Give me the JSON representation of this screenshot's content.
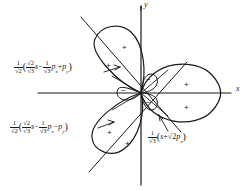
{
  "figure": {
    "axes": {
      "x_label": "x",
      "y_label": "y",
      "origin": [
        141,
        93
      ]
    },
    "annotations": [
      {
        "id": "upper-left-orbital",
        "position": "upper-left",
        "prefix_frac": {
          "num": "1",
          "den": "√2"
        },
        "open_paren": "(",
        "inner_frac": {
          "num": "√2",
          "den": "√3"
        },
        "orbital1": "s",
        "op1": "−",
        "second_frac": {
          "num": "1",
          "den": "√3"
        },
        "orbital2": "p",
        "orbital2_sub": "x",
        "op2": "+",
        "orbital3": "p",
        "orbital3_sub": "y",
        "close_paren": ")"
      },
      {
        "id": "lower-left-orbital",
        "position": "lower-left",
        "prefix_frac": {
          "num": "1",
          "den": "√2"
        },
        "open_paren": "(",
        "inner_frac": {
          "num": "√2",
          "den": "√3"
        },
        "orbital1": "s",
        "op1": "−",
        "second_frac": {
          "num": "1",
          "den": "√3"
        },
        "orbital2": "p",
        "orbital2_sub": "x",
        "op2": "−",
        "orbital3": "p",
        "orbital3_sub": "y",
        "close_paren": ")"
      },
      {
        "id": "right-orbital",
        "position": "lower-right",
        "prefix_frac": {
          "num": "1",
          "den": "√3"
        },
        "open_paren": "(",
        "orbital1": "s",
        "op1": "+",
        "radical": "√2",
        "orbital2": "p",
        "orbital2_sub": "x",
        "close_paren": ")"
      }
    ],
    "lobe_signs": [
      {
        "name": "plus-upper-lobe-outer",
        "text": "+",
        "x": 122,
        "y": 44
      },
      {
        "name": "plus-upper-lobe-inner",
        "text": "+",
        "x": 106,
        "y": 62
      },
      {
        "name": "plus-right-lobe-upper",
        "text": "+",
        "x": 184,
        "y": 81
      },
      {
        "name": "plus-right-lobe-lower",
        "text": "+",
        "x": 184,
        "y": 104
      },
      {
        "name": "plus-lower-lobe-inner",
        "text": "+",
        "x": 107,
        "y": 129
      },
      {
        "name": "plus-lower-lobe-outer",
        "text": "+",
        "x": 125,
        "y": 140
      },
      {
        "name": "minus-small-lobe-upper",
        "text": "−",
        "x": 146,
        "y": 79
      },
      {
        "name": "minus-small-lobe-left",
        "text": "−",
        "x": 124,
        "y": 90
      },
      {
        "name": "minus-small-lobe-lower",
        "text": "−",
        "x": 146,
        "y": 102
      }
    ],
    "colors": {
      "ink": "#1a1a1a",
      "background": "#ffffff"
    }
  }
}
